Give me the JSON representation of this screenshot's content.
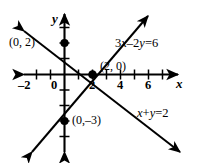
{
  "chart_data": {
    "type": "line",
    "title": "",
    "xlabel": "x",
    "ylabel": "y",
    "grid": false,
    "legend": "inline-annotations",
    "xlim": [
      -2.8,
      7.6
    ],
    "ylim": [
      -4.6,
      4.4
    ],
    "xticks": [
      -2,
      -1,
      0,
      1,
      2,
      3,
      4,
      5,
      6,
      7
    ],
    "xtick_labels": [
      "-2",
      "",
      "0",
      "",
      "2",
      "",
      "4",
      "",
      "6",
      ""
    ],
    "yticks": [
      -4,
      -3,
      -2,
      -1,
      1,
      2,
      3,
      4
    ],
    "ytick_labels": [
      "",
      "",
      "",
      "",
      "",
      "",
      "",
      ""
    ],
    "series": [
      {
        "name": "x+y=2",
        "equation": "x+y=2",
        "slope": -1,
        "intercept": 2,
        "points": [
          [
            0,
            2
          ],
          [
            2,
            0
          ]
        ],
        "style": "solid-double-arrow"
      },
      {
        "name": "3x-2y=6",
        "equation": "3x−2y=6",
        "slope": 1.5,
        "intercept": -3,
        "points": [
          [
            0,
            -3
          ],
          [
            2,
            0
          ]
        ],
        "style": "solid-double-arrow"
      }
    ],
    "marked_points": [
      {
        "label": "(0, 2)",
        "x": 0,
        "y": 2
      },
      {
        "label": "(2, 0)",
        "x": 2,
        "y": 0
      },
      {
        "label": "(0,−3)",
        "x": 0,
        "y": -3
      }
    ],
    "annotations": [
      {
        "text": "3x−2y=6",
        "x": 3.6,
        "y": 2.5
      },
      {
        "text": "x+y=2",
        "x": 5.0,
        "y": -2.4
      }
    ]
  },
  "axes": {
    "x_axis_label": "x",
    "y_axis_label": "y",
    "origin_label": "0",
    "x_tick_neg2": "–2",
    "x_tick_2": "2",
    "x_tick_4": "4",
    "x_tick_6": "6"
  },
  "labels": {
    "point_0_2": "(0, 2)",
    "point_2_0": "(2, 0)",
    "point_0_neg3": "(0,–3)",
    "equation_line1_prefix": "3",
    "equation_line1": "3x–2y=6",
    "equation_line2": "x+y=2"
  },
  "colors": {
    "stroke": "#000000",
    "background": "#ffffff",
    "point_fill": "#000000"
  }
}
